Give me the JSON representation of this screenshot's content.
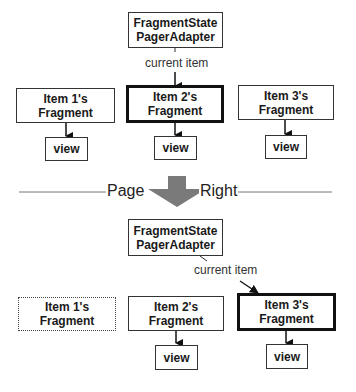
{
  "before": {
    "adapter": {
      "line1": "FragmentState",
      "line2": "PagerAdapter"
    },
    "current_item_label": "current item",
    "fragments": [
      {
        "line1": "Item 1's",
        "line2": "Fragment",
        "state": "normal",
        "view": "view"
      },
      {
        "line1": "Item 2's",
        "line2": "Fragment",
        "state": "current",
        "view": "view"
      },
      {
        "line1": "Item 3's",
        "line2": "Fragment",
        "state": "normal",
        "view": "view"
      }
    ]
  },
  "transition": {
    "left_label": "Page",
    "right_label": "Right",
    "arrow_color": "#7a7a7a"
  },
  "after": {
    "adapter": {
      "line1": "FragmentState",
      "line2": "PagerAdapter"
    },
    "current_item_label": "current item",
    "fragments": [
      {
        "line1": "Item 1's",
        "line2": "Fragment",
        "state": "destroyed"
      },
      {
        "line1": "Item 2's",
        "line2": "Fragment",
        "state": "normal",
        "view": "view"
      },
      {
        "line1": "Item 3's",
        "line2": "Fragment",
        "state": "current",
        "view": "view"
      }
    ]
  }
}
